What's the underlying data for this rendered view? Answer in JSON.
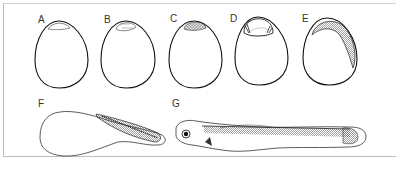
{
  "figure": {
    "panels": [
      {
        "id": "A",
        "label": "A",
        "stage": "egg-early-blastodisc"
      },
      {
        "id": "B",
        "label": "B",
        "stage": "egg-blastodisc-cleavage"
      },
      {
        "id": "C",
        "label": "C",
        "stage": "egg-morula"
      },
      {
        "id": "D",
        "label": "D",
        "stage": "egg-blastula"
      },
      {
        "id": "E",
        "label": "E",
        "stage": "egg-embryo-on-yolk"
      },
      {
        "id": "F",
        "label": "F",
        "stage": "embryo-with-yolk-sac"
      },
      {
        "id": "G",
        "label": "G",
        "stage": "larva"
      }
    ]
  }
}
